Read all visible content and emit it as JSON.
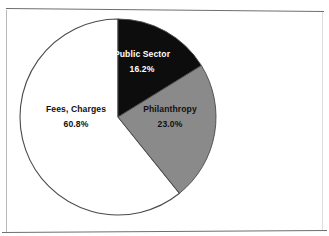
{
  "figure": {
    "background_color": "#ffffff",
    "frame": {
      "top_rule": "top-horizontal-rule",
      "bottom_rule": "bottom-horizontal-rule",
      "left_rule": "left-vertical-rule",
      "right_rule": "right-vertical-rule",
      "rule_color": "#6e6e6e"
    }
  },
  "chart_data": {
    "type": "pie",
    "title": "",
    "subtitle": "",
    "xlabel": "",
    "ylabel": "",
    "legend_position": "none",
    "labels_inside_slices": true,
    "start_angle_deg": 0,
    "direction": "clockwise",
    "center": {
      "x": 118,
      "y": 117
    },
    "radius": 98,
    "outline_color": "#4a4a4a",
    "categories": [
      "Public Sector",
      "Philanthropy",
      "Fees, Charges"
    ],
    "values": [
      16.2,
      23.0,
      60.8
    ],
    "value_labels": [
      "16.2%",
      "23.0%",
      "60.8%"
    ],
    "colors": [
      "#0d0d0d",
      "#8a8a8a",
      "#ffffff"
    ],
    "label_text_colors": [
      "#ffffff",
      "#111111",
      "#111111"
    ],
    "slices": [
      {
        "name": "Public Sector",
        "value": 16.2,
        "value_label": "16.2%",
        "color": "#0d0d0d",
        "label_color": "#ffffff",
        "start_angle_deg": 0.0,
        "end_angle_deg": 58.3
      },
      {
        "name": "Philanthropy",
        "value": 23.0,
        "value_label": "23.0%",
        "color": "#8a8a8a",
        "label_color": "#111111",
        "start_angle_deg": 58.3,
        "end_angle_deg": 141.1
      },
      {
        "name": "Fees, Charges",
        "value": 60.8,
        "value_label": "60.8%",
        "color": "#ffffff",
        "label_color": "#111111",
        "start_angle_deg": 141.1,
        "end_angle_deg": 360.0
      }
    ]
  }
}
